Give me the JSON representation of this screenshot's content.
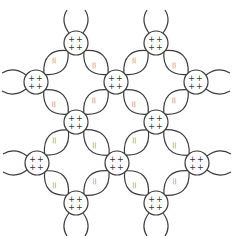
{
  "diagram": {
    "type": "metallic-lattice",
    "stroke_color": "#3a3a3a",
    "background": "#ffffff",
    "atom_radius": 12,
    "atom_label": "++\n++",
    "bond_label": "||",
    "atoms": [
      {
        "x": 76,
        "y": 43
      },
      {
        "x": 156,
        "y": 43
      },
      {
        "x": 36,
        "y": 82
      },
      {
        "x": 116,
        "y": 82
      },
      {
        "x": 196,
        "y": 82
      },
      {
        "x": 76,
        "y": 122
      },
      {
        "x": 156,
        "y": 122
      },
      {
        "x": 37,
        "y": 163
      },
      {
        "x": 117,
        "y": 163
      },
      {
        "x": 197,
        "y": 163
      },
      {
        "x": 76,
        "y": 203
      },
      {
        "x": 156,
        "y": 203
      }
    ],
    "bonds": [
      [
        0,
        2
      ],
      [
        0,
        3
      ],
      [
        1,
        3
      ],
      [
        1,
        4
      ],
      [
        2,
        5
      ],
      [
        3,
        5
      ],
      [
        3,
        6
      ],
      [
        4,
        6
      ],
      [
        5,
        7
      ],
      [
        5,
        8
      ],
      [
        6,
        8
      ],
      [
        6,
        9
      ],
      [
        7,
        10
      ],
      [
        8,
        10
      ],
      [
        8,
        11
      ],
      [
        9,
        11
      ]
    ],
    "stubs": [
      {
        "atom": 0,
        "dir": "up"
      },
      {
        "atom": 1,
        "dir": "up"
      },
      {
        "atom": 2,
        "dir": "left"
      },
      {
        "atom": 4,
        "dir": "right"
      },
      {
        "atom": 7,
        "dir": "left"
      },
      {
        "atom": 9,
        "dir": "right"
      },
      {
        "atom": 10,
        "dir": "down"
      },
      {
        "atom": 11,
        "dir": "down"
      }
    ]
  }
}
